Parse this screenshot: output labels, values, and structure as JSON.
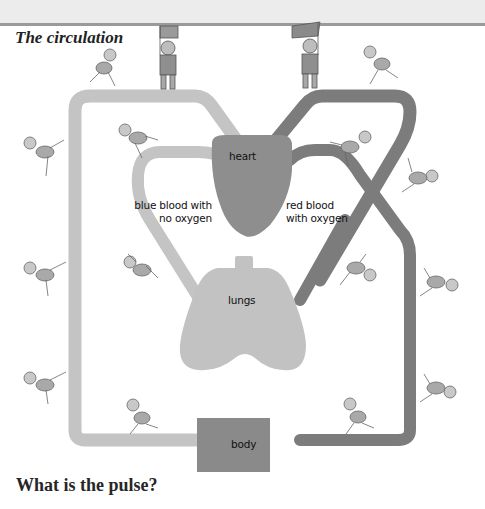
{
  "page": {
    "title": "The circulation",
    "subheading": "What is the pulse?"
  },
  "diagram": {
    "organs": {
      "heart": "heart",
      "lungs": "lungs",
      "body": "body"
    },
    "labels": {
      "blue_blood_line1": "blue blood with",
      "blue_blood_line2": "no oxygen",
      "red_blood_line1": "red blood",
      "red_blood_line2": "with oxygen"
    },
    "colors": {
      "blue_vessel": "#c4c4c4",
      "red_vessel": "#7c7c7c",
      "heart": "#8e8e8e",
      "lungs": "#c2c2c2",
      "body": "#8a8a8a",
      "header_band": "#ececec",
      "header_rule": "#9a9a9a"
    },
    "figures": {
      "flag_bearers": 2,
      "runners": 14
    }
  }
}
